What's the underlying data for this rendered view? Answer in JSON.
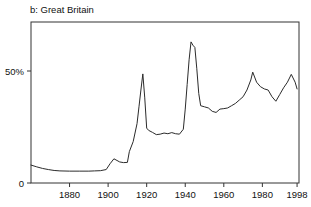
{
  "figure": {
    "panel_label": "b: Great Britain"
  },
  "chart_data": {
    "type": "line",
    "title": "b: Great Britain",
    "xlabel": "",
    "ylabel": "",
    "grid": false,
    "legend": null,
    "xlim": [
      1860,
      1999
    ],
    "ylim": [
      0,
      73
    ],
    "y_tick_values": [
      0,
      50
    ],
    "y_tick_labels": [
      "0",
      "50%"
    ],
    "x_tick_values": [
      1880,
      1900,
      1920,
      1940,
      1960,
      1980,
      1998
    ],
    "x_tick_labels": [
      "1880",
      "1900",
      "1920",
      "1940",
      "1960",
      "1980",
      "1998"
    ],
    "series": [
      {
        "name": "Great Britain top marginal tax rate",
        "x": [
          1860,
          1863,
          1866,
          1869,
          1872,
          1875,
          1880,
          1885,
          1890,
          1893,
          1896,
          1899,
          1901,
          1903,
          1906,
          1908,
          1910,
          1911,
          1913,
          1915,
          1916,
          1917,
          1918,
          1919,
          1920,
          1921,
          1923,
          1925,
          1927,
          1929,
          1931,
          1933,
          1935,
          1937,
          1939,
          1940,
          1941,
          1942,
          1943,
          1944,
          1945,
          1946,
          1947,
          1948,
          1950,
          1952,
          1954,
          1956,
          1958,
          1960,
          1962,
          1964,
          1966,
          1968,
          1970,
          1972,
          1974,
          1975,
          1977,
          1979,
          1981,
          1983,
          1985,
          1987,
          1989,
          1991,
          1993,
          1995,
          1997,
          1998
        ],
        "y": [
          8.0,
          7.2,
          6.5,
          6.0,
          5.6,
          5.4,
          5.3,
          5.3,
          5.3,
          5.4,
          5.5,
          6.0,
          8.6,
          10.8,
          9.4,
          9.1,
          9.2,
          14.0,
          18.5,
          26.5,
          34.0,
          41.5,
          48.7,
          38.0,
          24.5,
          23.5,
          22.6,
          21.6,
          21.8,
          22.3,
          22.0,
          22.5,
          22.0,
          21.8,
          24.0,
          33.0,
          44.0,
          55.0,
          63.0,
          61.5,
          60.5,
          51.0,
          40.0,
          34.5,
          34.0,
          33.5,
          32.0,
          31.5,
          33.0,
          33.2,
          33.5,
          34.5,
          35.5,
          37.0,
          38.5,
          41.5,
          46.0,
          49.5,
          45.0,
          43.0,
          42.0,
          41.5,
          38.5,
          36.5,
          39.5,
          42.5,
          45.0,
          48.5,
          45.0,
          42.0
        ]
      }
    ]
  }
}
